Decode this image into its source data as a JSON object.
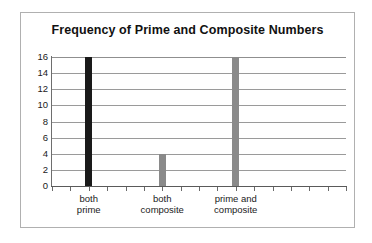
{
  "chart_data": {
    "type": "bar",
    "title": "Frequency of Prime and Composite Numbers",
    "xlabel": "",
    "ylabel": "",
    "categories": [
      "both\nprime",
      "both\ncomposite",
      "prime and\ncomposite"
    ],
    "values": [
      16,
      4,
      16
    ],
    "bar_colors": [
      "#1a1a1a",
      "#8a8a8a",
      "#8a8a8a"
    ],
    "ylim": [
      0,
      16
    ],
    "ytick_labels": [
      "16",
      "14",
      "12",
      "10",
      "8",
      "6",
      "4",
      "2",
      "0"
    ],
    "ytick_values": [
      16,
      14,
      12,
      10,
      8,
      6,
      4,
      2,
      0
    ],
    "grid": true,
    "grid_axis": "y",
    "legend": false,
    "x_tick_count": 17,
    "series": [
      {
        "name": "Frequency",
        "values": [
          16,
          4,
          16
        ]
      }
    ]
  },
  "style": {
    "frame_border_color": "#b0b0b0",
    "gridline_color": "#9a9a9a",
    "axis_color": "#5a5a5a",
    "text_color": "#1a1a1a",
    "background": "#ffffff"
  }
}
